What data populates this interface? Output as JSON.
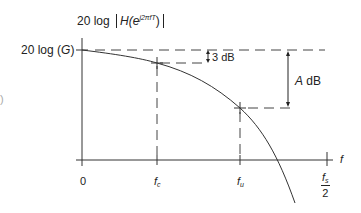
{
  "diagram": {
    "type": "frequency-response-magnitude",
    "y_axis_label": {
      "prefix": "20 log",
      "func": "H(e",
      "exponent": "j2πfT",
      "close": ")"
    },
    "y_level_label": {
      "prefix": "20 log (",
      "var": "G",
      "close": ")"
    },
    "x_axis_label": "f",
    "x_ticks": [
      {
        "label": "0"
      },
      {
        "label": "f",
        "sub": "c"
      },
      {
        "label": "f",
        "sub": "u"
      },
      {
        "label_num": "f",
        "label_num_sub": "s",
        "label_den": "2"
      }
    ],
    "annotations": {
      "three_db": "3 dB",
      "a_db_var": "A",
      "a_db_unit": " dB"
    },
    "stray_paren": ")"
  }
}
